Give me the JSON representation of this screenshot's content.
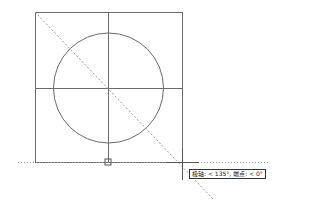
{
  "app": "CAD drawing viewport",
  "colors": {
    "geometry": "#6b6b6b",
    "tracking_line": "#9a9a9a",
    "cursor": "#555555",
    "background": "#ffffff"
  },
  "drawing": {
    "objects": [
      "square",
      "inscribed-circle",
      "vertical-centerline",
      "horizontal-centerline"
    ],
    "tracking": {
      "polar_angle": "135°",
      "endpoint_angle": "0°"
    }
  },
  "tooltip": {
    "text": "极轴: < 135°, 端点: < 0°"
  },
  "icons": {
    "snap_marker": "endpoint-snap-marker",
    "cursor": "crosshair-cursor"
  }
}
